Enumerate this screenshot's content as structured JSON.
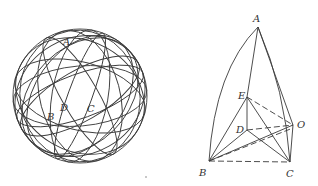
{
  "left_figure": {
    "description": "Sphere drawn with many great circles",
    "labels": [
      {
        "text": "A",
        "x": 63,
        "y": 45
      },
      {
        "text": "D",
        "x": 60,
        "y": 111
      },
      {
        "text": "C",
        "x": 87,
        "y": 112
      },
      {
        "text": "B",
        "x": 47,
        "y": 120
      }
    ]
  },
  "right_figure": {
    "description": "Spherical triangle ABC with center O and interior points D, E",
    "labels": [
      {
        "text": "A",
        "x": 253,
        "y": 22
      },
      {
        "text": "E",
        "x": 238,
        "y": 99
      },
      {
        "text": "D",
        "x": 236,
        "y": 133
      },
      {
        "text": "O",
        "x": 297,
        "y": 128
      },
      {
        "text": "B",
        "x": 199,
        "y": 176
      },
      {
        "text": "C",
        "x": 286,
        "y": 177
      }
    ],
    "points": {
      "A": [
        258,
        27
      ],
      "E": [
        247,
        97
      ],
      "D": [
        247,
        130
      ],
      "O": [
        293,
        125
      ],
      "B": [
        209,
        161
      ],
      "C": [
        290,
        162
      ]
    }
  },
  "stroke_color": "#3a3a3a",
  "background_color": "#ffffff"
}
